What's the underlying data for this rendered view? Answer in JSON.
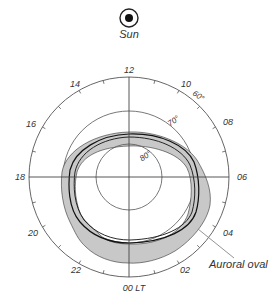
{
  "diagram": {
    "type": "polar-plot",
    "sun": {
      "label": "Sun",
      "icon": "sun-symbol"
    },
    "local_time_labels": [
      {
        "label": "12",
        "hour": 12
      },
      {
        "label": "10",
        "hour": 10
      },
      {
        "label": "08",
        "hour": 8
      },
      {
        "label": "06",
        "hour": 6
      },
      {
        "label": "04",
        "hour": 4
      },
      {
        "label": "02",
        "hour": 2
      },
      {
        "label": "00 LT",
        "hour": 0
      },
      {
        "label": "22",
        "hour": 22
      },
      {
        "label": "20",
        "hour": 20
      },
      {
        "label": "18",
        "hour": 18
      },
      {
        "label": "16",
        "hour": 16
      },
      {
        "label": "14",
        "hour": 14
      }
    ],
    "latitude_circles": [
      {
        "label": "60°",
        "latitude": 60
      },
      {
        "label": "70°",
        "latitude": 70
      },
      {
        "label": "80°",
        "latitude": 80
      }
    ],
    "oval_label": "Auroral oval",
    "colors": {
      "line": "#555555",
      "oval_fill": "#c8c8c8",
      "oval_edge": "#222222",
      "text": "#333333"
    }
  }
}
